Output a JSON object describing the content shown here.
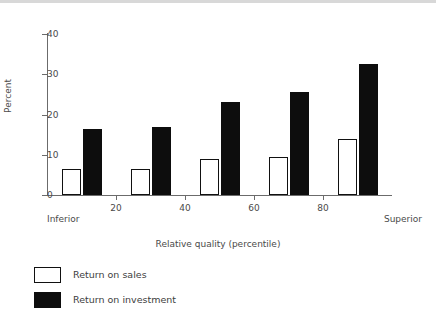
{
  "chart_data": {
    "type": "bar",
    "title": "",
    "subtitle": "",
    "xlabel": "Relative quality (percentile)",
    "ylabel": "Percent",
    "xlim": [
      0,
      100
    ],
    "ylim": [
      0,
      40
    ],
    "grid": false,
    "legend_position": "below-left",
    "x_tick_labels": [
      "20",
      "40",
      "60",
      "80"
    ],
    "x_tick_values": [
      20,
      40,
      60,
      80
    ],
    "y_tick_labels": [
      "0",
      "10",
      "20",
      "30",
      "40"
    ],
    "y_tick_values": [
      0,
      10,
      20,
      30,
      40
    ],
    "x_axis_end_labels": {
      "left": "Inferior",
      "right": "Superior"
    },
    "categories": [
      "0-20",
      "20-40",
      "40-60",
      "60-80",
      "80-100"
    ],
    "category_centers": [
      10,
      30,
      50,
      70,
      90
    ],
    "series": [
      {
        "name": "Return on sales",
        "color": "#ffffff",
        "edge_color": "#111111",
        "values": [
          6.5,
          6.5,
          9.0,
          9.5,
          14.0
        ]
      },
      {
        "name": "Return on investment",
        "color": "#0d0d0d",
        "edge_color": "#0d0d0d",
        "values": [
          16.5,
          17.0,
          23.0,
          25.5,
          32.5
        ]
      }
    ]
  },
  "legend": {
    "items": [
      {
        "label": "Return on sales",
        "swatch": "open-square-swatch"
      },
      {
        "label": "Return on investment",
        "swatch": "filled-square-swatch"
      }
    ]
  },
  "colors": {
    "background": "#ffffff",
    "axis": "#6b6b6b",
    "text": "#3d3d3d",
    "bar_fill": "#0d0d0d",
    "bar_open": "#ffffff",
    "top_band": "#d8d8d8"
  }
}
